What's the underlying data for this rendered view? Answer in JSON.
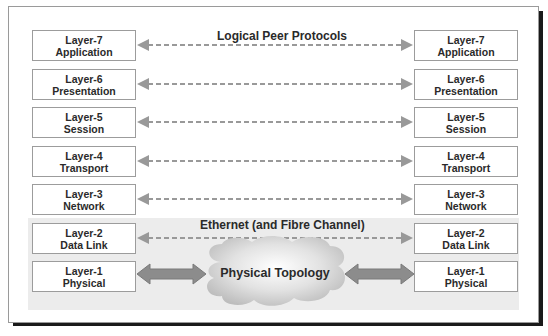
{
  "diagram": {
    "header_label": "Logical Peer Protocols",
    "band_label": "Ethernet (and Fibre Channel)",
    "cloud_label": "Physical Topology",
    "colors": {
      "arrow": "#999999",
      "band": "#ececec",
      "box_border": "#9c9c9c",
      "text": "#2a2a2a"
    },
    "left_stack": [
      {
        "layer": "Layer-7",
        "name": "Application"
      },
      {
        "layer": "Layer-6",
        "name": "Presentation"
      },
      {
        "layer": "Layer-5",
        "name": "Session"
      },
      {
        "layer": "Layer-4",
        "name": "Transport"
      },
      {
        "layer": "Layer-3",
        "name": "Network"
      },
      {
        "layer": "Layer-2",
        "name": "Data Link"
      },
      {
        "layer": "Layer-1",
        "name": "Physical"
      }
    ],
    "right_stack": [
      {
        "layer": "Layer-7",
        "name": "Application"
      },
      {
        "layer": "Layer-6",
        "name": "Presentation"
      },
      {
        "layer": "Layer-5",
        "name": "Session"
      },
      {
        "layer": "Layer-4",
        "name": "Transport"
      },
      {
        "layer": "Layer-3",
        "name": "Network"
      },
      {
        "layer": "Layer-2",
        "name": "Data Link"
      },
      {
        "layer": "Layer-1",
        "name": "Physical"
      }
    ],
    "connections": [
      {
        "from": "Layer-7",
        "to": "Layer-7",
        "style": "dashed"
      },
      {
        "from": "Layer-6",
        "to": "Layer-6",
        "style": "dashed"
      },
      {
        "from": "Layer-5",
        "to": "Layer-5",
        "style": "dashed"
      },
      {
        "from": "Layer-4",
        "to": "Layer-4",
        "style": "dashed"
      },
      {
        "from": "Layer-3",
        "to": "Layer-3",
        "style": "dashed"
      },
      {
        "from": "Layer-2",
        "to": "Layer-2",
        "style": "dashed"
      },
      {
        "from": "Layer-1",
        "to": "Physical Topology",
        "style": "solid-double"
      }
    ]
  }
}
